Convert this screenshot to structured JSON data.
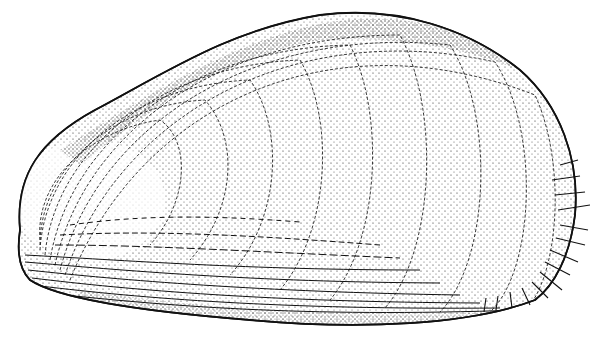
{
  "illustration": {
    "subject": "mussel shell",
    "style": "black ink stipple engraving",
    "colors": {
      "ink": "#111111",
      "background": "#ffffff"
    },
    "features": [
      "concentric growth rings",
      "stippled shading",
      "ventral striations",
      "posterior bristles"
    ]
  }
}
